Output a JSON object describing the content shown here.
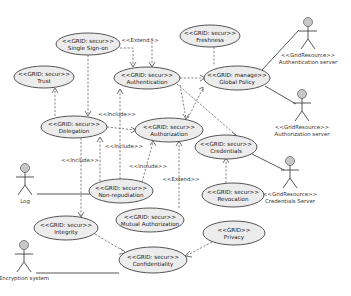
{
  "use_cases": [
    {
      "id": "sso",
      "stereotype": "<<GRID: secur>>",
      "name": "Single Sign-on",
      "cx": 88,
      "cy": 44,
      "rx": 32,
      "ry": 11
    },
    {
      "id": "freshness",
      "stereotype": "<<GRID: secur>>",
      "name": "Freshness",
      "cx": 210,
      "cy": 36,
      "rx": 30,
      "ry": 11
    },
    {
      "id": "trust",
      "stereotype": "<<GRID: secur>>",
      "name": "Trust",
      "cx": 44,
      "cy": 77,
      "rx": 30,
      "ry": 11
    },
    {
      "id": "authentication",
      "stereotype": "<<GRID: secur>>",
      "name": "Authentication",
      "cx": 147,
      "cy": 78,
      "rx": 33,
      "ry": 11
    },
    {
      "id": "globalpolicy",
      "stereotype": "<<GRID: manage>>",
      "name": "Global Policy",
      "cx": 237,
      "cy": 78,
      "rx": 33,
      "ry": 12
    },
    {
      "id": "delegation",
      "stereotype": "<<GRID: secur>>",
      "name": "Delegation",
      "cx": 74,
      "cy": 127,
      "rx": 33,
      "ry": 11
    },
    {
      "id": "authorization",
      "stereotype": "<<GRID: secur>>",
      "name": "Authorization",
      "cx": 169,
      "cy": 130,
      "rx": 34,
      "ry": 12
    },
    {
      "id": "credentials",
      "stereotype": "<<GRID: secur>>",
      "name": "Credentials",
      "cx": 226,
      "cy": 147,
      "rx": 31,
      "ry": 12
    },
    {
      "id": "nonrepudiation",
      "stereotype": "<<GRID: secur>>",
      "name": "Non-repudiation",
      "cx": 121,
      "cy": 191,
      "rx": 32,
      "ry": 12
    },
    {
      "id": "revocation",
      "stereotype": "<<GRID: secur>>",
      "name": "Revocation",
      "cx": 233,
      "cy": 195,
      "rx": 31,
      "ry": 12
    },
    {
      "id": "integrity",
      "stereotype": "<<GRID: secur>>",
      "name": "Integrity",
      "cx": 66,
      "cy": 228,
      "rx": 32,
      "ry": 12
    },
    {
      "id": "mutualauth",
      "stereotype": "<<GRID: secur>>",
      "name": "Mutual Authorization",
      "cx": 150,
      "cy": 220,
      "rx": 34,
      "ry": 12
    },
    {
      "id": "privacy",
      "stereotype": "<<GRID>>",
      "name": "Privacy",
      "cx": 234,
      "cy": 233,
      "rx": 31,
      "ry": 12
    },
    {
      "id": "confidentiality",
      "stereotype": "<<GRID: secur>>",
      "name": "Confidentiality",
      "cx": 153,
      "cy": 260,
      "rx": 34,
      "ry": 13
    }
  ],
  "actors": [
    {
      "id": "authserver",
      "stereotype": "<<GridResource>>",
      "name": "Authentication server",
      "x": 308,
      "y": 22
    },
    {
      "id": "authzserver",
      "stereotype": "<<GridResource>>",
      "name": "Authorization server",
      "x": 302,
      "y": 94
    },
    {
      "id": "credserver",
      "stereotype": "<<GridResource>>",
      "name": "Credentials Server",
      "x": 290,
      "y": 161
    },
    {
      "id": "log",
      "stereotype": "",
      "name": "Log",
      "x": 25,
      "y": 168
    },
    {
      "id": "encryption",
      "stereotype": "",
      "name": "Encryption system",
      "x": 24,
      "y": 245
    }
  ],
  "relations": {
    "extend_label": "<<Extend>>",
    "include_label": "<<Include>>"
  },
  "labels": [
    {
      "text": "<<Extend>>",
      "x": 140,
      "y": 42
    },
    {
      "text": "<<Include>>",
      "x": 117,
      "y": 116
    },
    {
      "text": "<<Include>>",
      "x": 124,
      "y": 148
    },
    {
      "text": "<<Include>>",
      "x": 80,
      "y": 162
    },
    {
      "text": "<<Include>>",
      "x": 148,
      "y": 168
    },
    {
      "text": "<<Extend>>",
      "x": 181,
      "y": 181
    }
  ]
}
